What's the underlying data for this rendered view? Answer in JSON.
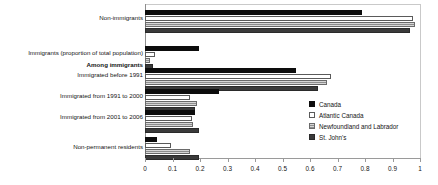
{
  "chart_data": {
    "type": "bar",
    "orientation": "horizontal",
    "title": "",
    "subtitle": "",
    "xlabel": "",
    "ylabel": "",
    "xlim": [
      0,
      1
    ],
    "grid": false,
    "legend_position": "right-middle",
    "tick_labels": [
      "0",
      "0.1",
      "0.2",
      "0.3",
      "0.4",
      "0.5",
      "0.6",
      "0.7",
      "0.8",
      "0.9",
      "1"
    ],
    "tick_values": [
      0,
      0.1,
      0.2,
      0.3,
      0.4,
      0.5,
      0.6,
      0.7,
      0.8,
      0.9,
      1
    ],
    "categories": [
      "Non-immigrants",
      "Immigrants (proportion of total population)",
      "Among immigrants",
      "Immigrated before 1991",
      "Immigrated from 1991 to 2000",
      "Immigrated from 2001 to 2006",
      "Non-permanent residents"
    ],
    "series": [
      {
        "name": "Canada",
        "color": "#0d0d0d",
        "values": [
          0.79,
          0.195,
          null,
          0.55,
          0.27,
          0.18,
          0.045
        ]
      },
      {
        "name": "Atlantic Canada",
        "color": "#ffffff",
        "values": [
          0.975,
          0.038,
          null,
          0.675,
          0.165,
          0.17,
          0.095
        ]
      },
      {
        "name": "Newfoundland and Labrador",
        "color": "#c8c8c8",
        "values": [
          0.98,
          0.018,
          null,
          0.66,
          0.19,
          0.175,
          0.165
        ]
      },
      {
        "name": "St. John's",
        "color": "#3a3a3a",
        "values": [
          0.965,
          0.028,
          null,
          0.63,
          0.18,
          0.195,
          0.195
        ]
      }
    ]
  },
  "axis": {
    "ticks": [
      {
        "label": "0",
        "value": 0
      },
      {
        "label": "0.1",
        "value": 0.1
      },
      {
        "label": "0.2",
        "value": 0.2
      },
      {
        "label": "0.3",
        "value": 0.3
      },
      {
        "label": "0.4",
        "value": 0.4
      },
      {
        "label": "0.5",
        "value": 0.5
      },
      {
        "label": "0.6",
        "value": 0.6
      },
      {
        "label": "0.7",
        "value": 0.7
      },
      {
        "label": "0.8",
        "value": 0.8
      },
      {
        "label": "0.9",
        "value": 0.9
      },
      {
        "label": "1",
        "value": 1
      }
    ]
  },
  "labels": {
    "non_immigrants": "Non-immigrants",
    "immigrants_proportion": "Immigrants (proportion of total population)",
    "among_immigrants": "Among immigrants",
    "before_1991": "Immigrated before 1991",
    "from_1991_2000": "Immigrated from 1991 to 2000",
    "from_2001_2006": "Immigrated from 2001 to 2006",
    "non_permanent": "Non-permanent residents"
  },
  "legend": {
    "items": [
      {
        "label": "Canada",
        "swatch": "canada-swatch"
      },
      {
        "label": "Atlantic Canada",
        "swatch": "atlantic-canada-swatch"
      },
      {
        "label": "Newfoundland and Labrador",
        "swatch": "newfoundland-labrador-swatch"
      },
      {
        "label": "St. John's",
        "swatch": "st-johns-swatch"
      }
    ]
  }
}
